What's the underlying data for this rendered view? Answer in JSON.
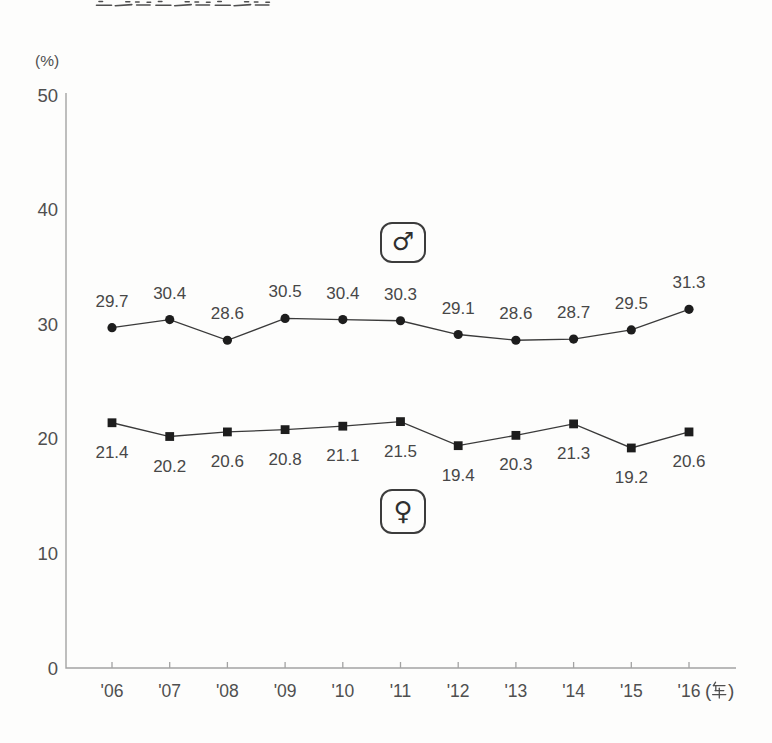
{
  "page": {
    "clipped_title": "肥満者の割合の変遷",
    "background": "#fdfdfc"
  },
  "chart_data": {
    "type": "line",
    "title": "",
    "y_unit_label": "(%)",
    "x_unit_label": "(年)",
    "categories": [
      "'06",
      "'07",
      "'08",
      "'09",
      "'10",
      "'11",
      "'12",
      "'13",
      "'14",
      "'15",
      "'16"
    ],
    "yticks": [
      0,
      10,
      20,
      30,
      40,
      50
    ],
    "ylim": [
      0,
      50
    ],
    "grid": false,
    "legend_position": "boxed-inline",
    "series": [
      {
        "name": "male",
        "symbol": "♂",
        "marker": "circle",
        "label_side": "above",
        "values": [
          29.7,
          30.4,
          28.6,
          30.5,
          30.4,
          30.3,
          29.1,
          28.6,
          28.7,
          29.5,
          31.3
        ]
      },
      {
        "name": "female",
        "symbol": "♀",
        "marker": "square",
        "label_side": "below",
        "values": [
          21.4,
          20.2,
          20.6,
          20.8,
          21.1,
          21.5,
          19.4,
          20.3,
          21.3,
          19.2,
          20.6
        ]
      }
    ],
    "colors": {
      "line": "#3a3a3a",
      "marker": "#1d1d1d",
      "axis": "#a3a3a3",
      "text": "#4f4f4f",
      "value_text": "#474747",
      "title_fragment": "#4f4f4f"
    }
  }
}
